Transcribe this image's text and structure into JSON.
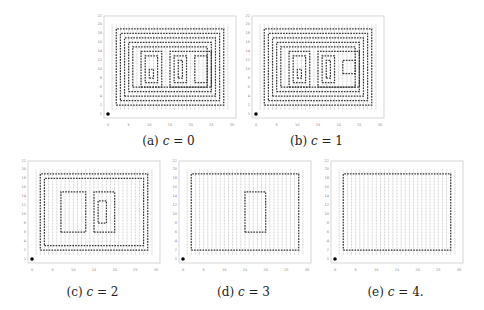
{
  "figure": {
    "panels": [
      {
        "id": "a",
        "label": "(a)",
        "var": "c",
        "eq": "=",
        "value": "0",
        "caption": "(a) c = 0"
      },
      {
        "id": "b",
        "label": "(b)",
        "var": "c",
        "eq": "=",
        "value": "1",
        "caption": "(b) c = 1"
      },
      {
        "id": "c",
        "label": "(c)",
        "var": "c",
        "eq": "=",
        "value": "2",
        "caption": "(c) c = 2"
      },
      {
        "id": "d",
        "label": "(d)",
        "var": "c",
        "eq": "=",
        "value": "3",
        "caption": "(d) c = 3"
      },
      {
        "id": "e",
        "label": "(e)",
        "var": "c",
        "eq": "=",
        "value": "4.",
        "caption": "(e) c = 4."
      }
    ],
    "axes": {
      "x_ticks": [
        "0",
        "5",
        "10",
        "15",
        "20",
        "25",
        "30"
      ],
      "y_ticks": [
        "1",
        "2",
        "4",
        "6",
        "8",
        "10",
        "12",
        "14",
        "16",
        "18",
        "20",
        "22"
      ]
    },
    "colors": {
      "grid": "#b8b8b8",
      "path": "#333333",
      "frame": "#cccccc",
      "start_marker": "#000000"
    }
  }
}
